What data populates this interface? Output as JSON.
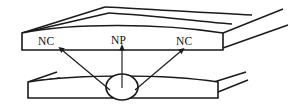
{
  "figure": {
    "name": "rolling-contact-neutral-point-diagram",
    "background_color": "#ffffff",
    "line_color": "#1a1a1a",
    "width": 290,
    "height": 107,
    "labels": {
      "nc_left": "NC",
      "np": "NP",
      "nc_right": "NC"
    },
    "label_meanings": {
      "nc": "NC",
      "np": "NP"
    },
    "elements": {
      "upper_slab_name": "upper-roll-slab",
      "lower_slab_name": "lower-roll-slab",
      "neutral_point_name": "neutral-point-ellipse",
      "leader_left_name": "nc-left-leader-arrow",
      "leader_center_name": "np-leader-arrow",
      "leader_right_name": "nc-right-leader-arrow"
    },
    "geometry": {
      "upper_slab_left_x": 22,
      "upper_slab_right_x": 223,
      "upper_slab_top_y": 33,
      "upper_slab_bottom_y": 50,
      "lower_slab_left_x": 28,
      "lower_slab_right_x": 218,
      "lower_slab_top_y": 82,
      "lower_slab_bottom_y": 98,
      "ellipse_center_x": 122,
      "ellipse_center_y": 87,
      "ellipse_rx": 16,
      "ellipse_ry": 13
    }
  }
}
